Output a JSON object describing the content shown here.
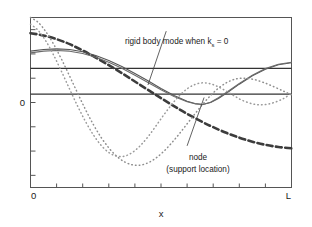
{
  "chart_data": {
    "type": "line",
    "title": "",
    "xlabel": "x",
    "ylabel": "",
    "xlim": [
      0,
      1
    ],
    "ylim": [
      -0.56,
      0.46
    ],
    "grid": false,
    "legend": null,
    "x_tick_labels": [
      "0",
      "L"
    ],
    "y_tick_labels": [
      "0"
    ],
    "x_tick_count": 11,
    "y_tick_count": 7,
    "node_x": 0.66,
    "reference_lines": [
      {
        "name": "zero-line",
        "y": 0
      },
      {
        "name": "upper-reference-line",
        "y": 0.155
      }
    ],
    "series": [
      {
        "name": "rigid-body-mode-dashed",
        "style": "dashed",
        "color": "#3c3c3c",
        "points": [
          [
            0.0,
            0.366
          ],
          [
            0.05,
            0.352
          ],
          [
            0.1,
            0.33
          ],
          [
            0.15,
            0.3
          ],
          [
            0.2,
            0.262
          ],
          [
            0.25,
            0.22
          ],
          [
            0.3,
            0.174
          ],
          [
            0.35,
            0.126
          ],
          [
            0.4,
            0.076
          ],
          [
            0.45,
            0.026
          ],
          [
            0.5,
            -0.024
          ],
          [
            0.55,
            -0.072
          ],
          [
            0.6,
            -0.118
          ],
          [
            0.66,
            -0.168
          ],
          [
            0.7,
            -0.198
          ],
          [
            0.75,
            -0.232
          ],
          [
            0.8,
            -0.261
          ],
          [
            0.85,
            -0.285
          ],
          [
            0.9,
            -0.304
          ],
          [
            0.95,
            -0.317
          ],
          [
            1.0,
            -0.325
          ]
        ]
      },
      {
        "name": "mode-solid-outer",
        "style": "solid",
        "color": "#555555",
        "points": [
          [
            0.0,
            0.258
          ],
          [
            0.05,
            0.268
          ],
          [
            0.1,
            0.272
          ],
          [
            0.15,
            0.268
          ],
          [
            0.2,
            0.254
          ],
          [
            0.25,
            0.232
          ],
          [
            0.3,
            0.202
          ],
          [
            0.35,
            0.166
          ],
          [
            0.4,
            0.124
          ],
          [
            0.45,
            0.08
          ],
          [
            0.5,
            0.034
          ],
          [
            0.55,
            -0.008
          ],
          [
            0.6,
            -0.042
          ],
          [
            0.63,
            -0.056
          ],
          [
            0.66,
            -0.062
          ],
          [
            0.69,
            -0.05
          ],
          [
            0.72,
            -0.026
          ],
          [
            0.76,
            0.016
          ],
          [
            0.8,
            0.06
          ],
          [
            0.85,
            0.11
          ],
          [
            0.9,
            0.15
          ],
          [
            0.95,
            0.176
          ],
          [
            1.0,
            0.188
          ]
        ]
      },
      {
        "name": "mode-solid-inner",
        "style": "solid",
        "color": "#6b6b6b",
        "points": [
          [
            0.0,
            0.248
          ],
          [
            0.05,
            0.258
          ],
          [
            0.1,
            0.262
          ],
          [
            0.15,
            0.258
          ],
          [
            0.2,
            0.244
          ],
          [
            0.25,
            0.222
          ],
          [
            0.3,
            0.192
          ],
          [
            0.35,
            0.156
          ],
          [
            0.4,
            0.114
          ],
          [
            0.45,
            0.07
          ],
          [
            0.5,
            0.026
          ],
          [
            0.55,
            -0.014
          ],
          [
            0.6,
            -0.046
          ],
          [
            0.63,
            -0.058
          ],
          [
            0.66,
            -0.062
          ],
          [
            0.69,
            -0.048
          ],
          [
            0.72,
            -0.022
          ],
          [
            0.76,
            0.02
          ],
          [
            0.8,
            0.064
          ],
          [
            0.85,
            0.114
          ],
          [
            0.9,
            0.154
          ],
          [
            0.95,
            0.18
          ],
          [
            1.0,
            0.192
          ]
        ]
      },
      {
        "name": "mode-dotted-first",
        "style": "dotted",
        "color": "#8e8e8e",
        "points": [
          [
            0.0,
            0.46
          ],
          [
            0.03,
            0.43
          ],
          [
            0.06,
            0.372
          ],
          [
            0.09,
            0.296
          ],
          [
            0.12,
            0.206
          ],
          [
            0.15,
            0.108
          ],
          [
            0.18,
            0.008
          ],
          [
            0.21,
            -0.09
          ],
          [
            0.24,
            -0.18
          ],
          [
            0.27,
            -0.258
          ],
          [
            0.3,
            -0.322
          ],
          [
            0.33,
            -0.372
          ],
          [
            0.36,
            -0.406
          ],
          [
            0.39,
            -0.424
          ],
          [
            0.42,
            -0.426
          ],
          [
            0.45,
            -0.412
          ],
          [
            0.48,
            -0.384
          ],
          [
            0.51,
            -0.344
          ],
          [
            0.54,
            -0.294
          ],
          [
            0.57,
            -0.238
          ],
          [
            0.6,
            -0.178
          ],
          [
            0.63,
            -0.118
          ],
          [
            0.66,
            -0.06
          ],
          [
            0.69,
            -0.008
          ],
          [
            0.72,
            0.036
          ],
          [
            0.75,
            0.068
          ],
          [
            0.78,
            0.088
          ],
          [
            0.81,
            0.096
          ],
          [
            0.85,
            0.09
          ],
          [
            0.89,
            0.072
          ],
          [
            0.93,
            0.046
          ],
          [
            0.97,
            0.018
          ],
          [
            1.0,
            -0.004
          ]
        ]
      },
      {
        "name": "mode-dotted-second",
        "style": "dotted",
        "color": "#9a9a9a",
        "points": [
          [
            0.0,
            0.42
          ],
          [
            0.03,
            0.382
          ],
          [
            0.06,
            0.316
          ],
          [
            0.09,
            0.23
          ],
          [
            0.12,
            0.132
          ],
          [
            0.15,
            0.03
          ],
          [
            0.18,
            -0.07
          ],
          [
            0.21,
            -0.162
          ],
          [
            0.24,
            -0.242
          ],
          [
            0.27,
            -0.306
          ],
          [
            0.3,
            -0.35
          ],
          [
            0.33,
            -0.372
          ],
          [
            0.36,
            -0.372
          ],
          [
            0.39,
            -0.35
          ],
          [
            0.42,
            -0.31
          ],
          [
            0.45,
            -0.256
          ],
          [
            0.48,
            -0.192
          ],
          [
            0.51,
            -0.126
          ],
          [
            0.54,
            -0.064
          ],
          [
            0.57,
            -0.01
          ],
          [
            0.6,
            0.032
          ],
          [
            0.63,
            0.058
          ],
          [
            0.66,
            0.068
          ],
          [
            0.69,
            0.062
          ],
          [
            0.72,
            0.044
          ],
          [
            0.75,
            0.018
          ],
          [
            0.78,
            -0.01
          ],
          [
            0.81,
            -0.036
          ],
          [
            0.85,
            -0.058
          ],
          [
            0.89,
            -0.064
          ],
          [
            0.93,
            -0.052
          ],
          [
            0.97,
            -0.026
          ],
          [
            1.0,
            0.006
          ]
        ]
      }
    ],
    "annotations": [
      {
        "name": "rigid-body-annotation",
        "text_main": "rigid body mode when k",
        "text_sub": "s",
        "text_tail": " = 0",
        "text_x": 0.38,
        "text_y": 0.405,
        "leader_from": [
          0.52,
          0.378
        ],
        "leader_to": [
          0.45,
          0.055
        ]
      },
      {
        "name": "node-annotation",
        "line1": "node",
        "line2": "(support location)",
        "text_x": 0.62,
        "text_y": -0.36,
        "leader_from": [
          0.6,
          -0.31
        ],
        "leader_to": [
          0.665,
          -0.02
        ]
      }
    ]
  },
  "axis": {
    "x_min_label": "0",
    "x_max_label": "L",
    "y_zero_label": "0",
    "x_axis_title": "x"
  },
  "annotations": {
    "rigid_body": {
      "main": "rigid body mode when k",
      "sub": "s",
      "tail": " = 0"
    },
    "node": {
      "line1": "node",
      "line2": "(support location)"
    }
  }
}
